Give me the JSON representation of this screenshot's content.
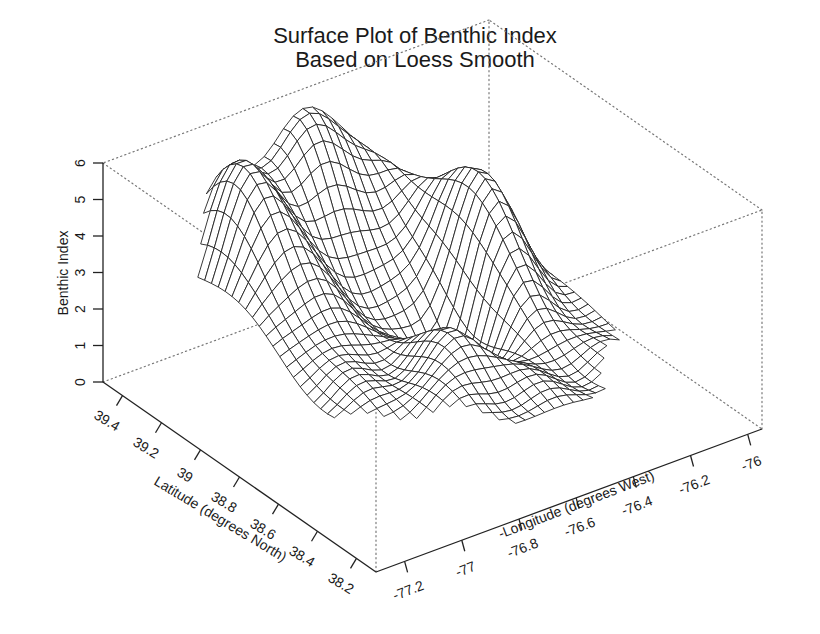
{
  "chart_data": {
    "type": "surface",
    "title": "Surface Plot of Benthic Index",
    "subtitle": "Based on Loess Smooth",
    "xlabel": "-Longitude (degrees West)",
    "ylabel": "Latitude (degrees North)",
    "zlabel": "Benthic Index",
    "x_ticks": [
      "-77.2",
      "-77",
      "-76.8",
      "-76.6",
      "-76.4",
      "-76.2",
      "-76"
    ],
    "y_ticks": [
      "39.4",
      "39.2",
      "39",
      "38.8",
      "38.6",
      "38.4",
      "38.2"
    ],
    "z_ticks": [
      "0",
      "1",
      "2",
      "3",
      "4",
      "5",
      "6"
    ],
    "xlim": [
      -77.3,
      -75.95
    ],
    "ylim": [
      38.1,
      39.5
    ],
    "zlim": [
      0,
      6
    ],
    "grid": false,
    "box": "dotted",
    "render": "wireframe mesh, black lines on white",
    "surface_peaks": [
      {
        "x": -76.9,
        "y": 39.35,
        "z": 5.0,
        "note": "left ridge peak"
      },
      {
        "x": -76.6,
        "y": 39.45,
        "z": 5.8,
        "note": "back plateau peak"
      },
      {
        "x": -76.3,
        "y": 39.0,
        "z": 5.0,
        "note": "right ridge"
      },
      {
        "x": -76.7,
        "y": 38.6,
        "z": 2.0,
        "note": "front hump"
      },
      {
        "x": -76.5,
        "y": 38.9,
        "z": 1.2,
        "note": "central trough"
      }
    ]
  }
}
